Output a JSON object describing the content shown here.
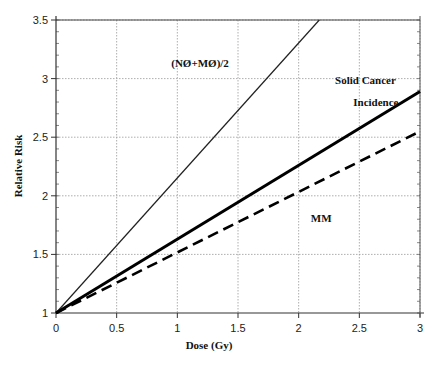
{
  "chart_data": {
    "type": "line",
    "title": "",
    "xlabel": "Dose (Gy)",
    "ylabel": "Relative Risk",
    "xlim": [
      0,
      3
    ],
    "ylim": [
      1,
      3.5
    ],
    "x_ticks": [
      "0",
      "0.5",
      "1",
      "1.5",
      "2",
      "2.5",
      "3"
    ],
    "y_ticks": [
      "1",
      "1.5",
      "2",
      "2.5",
      "3",
      "3.5"
    ],
    "grid": true,
    "series": [
      {
        "name": "(NØ+MØ)/2",
        "style": "thin-solid",
        "x": [
          0,
          2.17
        ],
        "y": [
          1,
          3.5
        ]
      },
      {
        "name": "Solid Cancer Incidence",
        "style": "thick-solid",
        "x": [
          0,
          3
        ],
        "y": [
          1,
          2.89
        ]
      },
      {
        "name": "MM",
        "style": "thick-dashed",
        "x": [
          0,
          3
        ],
        "y": [
          1,
          2.55
        ]
      }
    ],
    "annotations": [
      {
        "text": "(NØ+MØ)/2",
        "x": 0.95,
        "y": 3.1
      },
      {
        "text": "Solid Cancer",
        "x": 2.3,
        "y": 2.95
      },
      {
        "text": "Incidence",
        "x": 2.45,
        "y": 2.77
      },
      {
        "text": "MM",
        "x": 2.1,
        "y": 1.78
      }
    ]
  }
}
